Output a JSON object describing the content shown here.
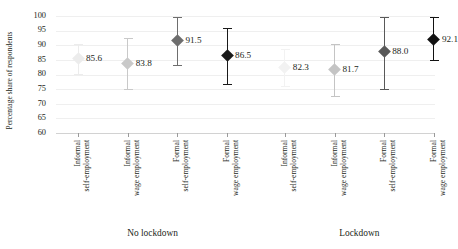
{
  "chart_data": {
    "type": "scatter",
    "title": "",
    "xlabel": "",
    "ylabel": "Percentage share of respondents",
    "ylim": [
      60,
      100
    ],
    "yticks": [
      100,
      95,
      90,
      85,
      80,
      75,
      70,
      65,
      60
    ],
    "grid": true,
    "legend": "none",
    "groups": [
      "No lockdown",
      "Lockdown"
    ],
    "categories": [
      "Informal self-employment",
      "Informal wage employment",
      "Formal self-employment",
      "Formal wage employment"
    ],
    "points": [
      {
        "group": "No lockdown",
        "category_line1": "Informal",
        "category_line2": "self-employment",
        "value": 85.6,
        "label": "85.6",
        "ci_low": 80.2,
        "ci_high": 90.4,
        "color": "#ececec"
      },
      {
        "group": "No lockdown",
        "category_line1": "Informal",
        "category_line2": "wage employment",
        "value": 83.8,
        "label": "83.8",
        "ci_low": 74.9,
        "ci_high": 92.4,
        "color": "#c9c9c9"
      },
      {
        "group": "No lockdown",
        "category_line1": "Formal",
        "category_line2": "self-employment",
        "value": 91.5,
        "label": "91.5",
        "ci_low": 83.2,
        "ci_high": 99.6,
        "color": "#6e6e6e"
      },
      {
        "group": "No lockdown",
        "category_line1": "Formal",
        "category_line2": "wage employment",
        "value": 86.5,
        "label": "86.5",
        "ci_low": 76.9,
        "ci_high": 95.9,
        "color": "#1a1a1a"
      },
      {
        "group": "Lockdown",
        "category_line1": "Informal",
        "category_line2": "self-employment",
        "value": 82.3,
        "label": "82.3",
        "ci_low": 76.0,
        "ci_high": 88.6,
        "color": "#f2f2f2"
      },
      {
        "group": "Lockdown",
        "category_line1": "Informal",
        "category_line2": "wage employment",
        "value": 81.7,
        "label": "81.7",
        "ci_low": 72.6,
        "ci_high": 90.3,
        "color": "#c4c4c4"
      },
      {
        "group": "Lockdown",
        "category_line1": "Formal",
        "category_line2": "self-employment",
        "value": 88.0,
        "label": "88.0",
        "ci_low": 75.1,
        "ci_high": 99.5,
        "color": "#595959"
      },
      {
        "group": "Lockdown",
        "category_line1": "Formal",
        "category_line2": "wage employment",
        "value": 92.1,
        "label": "92.1",
        "ci_low": 84.9,
        "ci_high": 99.8,
        "color": "#121212"
      }
    ]
  },
  "axes": {
    "y_title": "Percentage share of respondents"
  },
  "group_labels": [
    {
      "text": "No lockdown"
    },
    {
      "text": "Lockdown"
    }
  ],
  "colors": {
    "gridline": "#efefef",
    "axis": "#d2d2d2",
    "text": "#231f20",
    "background": "#ffffff"
  }
}
